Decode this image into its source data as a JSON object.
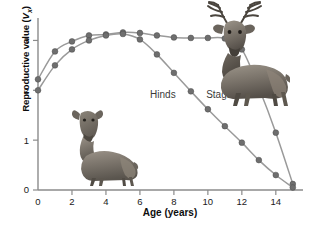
{
  "figure": {
    "caption_present": false
  },
  "axes": {
    "x": {
      "title": "Age (years)",
      "ticks": [
        0,
        2,
        4,
        6,
        8,
        10,
        12,
        14
      ],
      "tick_labels": [
        "0",
        "2",
        "4",
        "6",
        "8",
        "10",
        "12",
        "14"
      ],
      "min": 0,
      "max": 15.6
    },
    "y": {
      "title_prefix": "Reproductive value (",
      "title_symbol": "V",
      "title_subscript": "x",
      "title_suffix": ")",
      "title_plain": "Reproductive value (Vx)",
      "ticks": [
        0,
        1,
        2,
        3
      ],
      "tick_labels": [
        "0",
        "1",
        "2",
        "3"
      ],
      "min": 0,
      "max": 3.45
    }
  },
  "labels": {
    "hinds": "Hinds",
    "stags": "Stags"
  },
  "illustrations": {
    "hind": "red-deer-hind-illustration",
    "stag": "red-deer-stag-illustration"
  },
  "colors": {
    "axis": "#8b8b8b",
    "curve": "#9a9a9a",
    "marker_fill": "#6e6e6e",
    "text": "#1a1a1a",
    "background": "#ffffff"
  },
  "chart_data": {
    "type": "line",
    "title": "",
    "xlabel": "Age (years)",
    "ylabel": "Reproductive value (Vx)",
    "xlim": [
      0,
      15.6
    ],
    "ylim": [
      0,
      3.45
    ],
    "grid": false,
    "legend": "inline-labels",
    "x": [
      0,
      1,
      2,
      3,
      4,
      5,
      6,
      7,
      8,
      9,
      10,
      11,
      12,
      13,
      14,
      15
    ],
    "series": [
      {
        "name": "Hinds",
        "label_position": {
          "x": 6.6,
          "y": 1.85
        },
        "values": [
          2.22,
          2.78,
          2.98,
          3.1,
          3.12,
          3.16,
          3.15,
          3.1,
          3.06,
          3.05,
          3.05,
          3.04,
          2.82,
          2.05,
          1.15,
          0.12
        ]
      },
      {
        "name": "Stags",
        "label_position": {
          "x": 9.9,
          "y": 1.85
        },
        "values": [
          2.0,
          2.5,
          2.82,
          3.0,
          3.1,
          3.13,
          3.02,
          2.72,
          2.35,
          1.98,
          1.62,
          1.28,
          0.95,
          0.6,
          0.3,
          0.05
        ]
      }
    ]
  }
}
